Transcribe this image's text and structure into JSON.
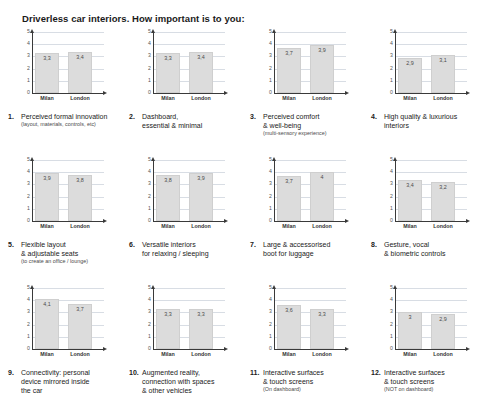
{
  "page": {
    "title": "Driverless car interiors. How important is to you:"
  },
  "axis": {
    "y_ticks": [
      "5",
      "4",
      "3",
      "2",
      "1",
      "0"
    ],
    "y_min": 0,
    "y_max": 5,
    "categories": [
      "Milan",
      "London"
    ]
  },
  "colors": {
    "bar_fill": "#dcdcdc",
    "bar_stroke": "#cfcfcf",
    "gridline": "#d8dde4",
    "axis": "#3a3a3a",
    "text": "#1a1a1a"
  },
  "chart_data": [
    {
      "type": "bar",
      "number": "1.",
      "title": "Perceived formal innovation",
      "subtitle": "(layout, materials, controls, etc)",
      "categories": [
        "Milan",
        "London"
      ],
      "values": [
        3.3,
        3.4
      ],
      "labels": [
        "3,3",
        "3,4"
      ],
      "ylim": [
        0,
        5
      ],
      "ylabel": "",
      "xlabel": "",
      "grid": true
    },
    {
      "type": "bar",
      "number": "2.",
      "title": "Dashboard,\nessential & minimal",
      "subtitle": "",
      "categories": [
        "Milan",
        "London"
      ],
      "values": [
        3.3,
        3.4
      ],
      "labels": [
        "3,3",
        "3,4"
      ],
      "ylim": [
        0,
        5
      ],
      "ylabel": "",
      "xlabel": "",
      "grid": true
    },
    {
      "type": "bar",
      "number": "3.",
      "title": "Perceived comfort\n& well-being",
      "subtitle": "(multi-sensory experience)",
      "categories": [
        "Milan",
        "London"
      ],
      "values": [
        3.7,
        3.9
      ],
      "labels": [
        "3,7",
        "3,9"
      ],
      "ylim": [
        0,
        5
      ],
      "ylabel": "",
      "xlabel": "",
      "grid": true
    },
    {
      "type": "bar",
      "number": "4.",
      "title": "High quality & luxurious\ninteriors",
      "subtitle": "",
      "categories": [
        "Milan",
        "London"
      ],
      "values": [
        2.9,
        3.1
      ],
      "labels": [
        "2,9",
        "3,1"
      ],
      "ylim": [
        0,
        5
      ],
      "ylabel": "",
      "xlabel": "",
      "grid": true
    },
    {
      "type": "bar",
      "number": "5.",
      "title": "Flexible layout\n& adjustable seats",
      "subtitle": "(to create an office / lounge)",
      "categories": [
        "Milan",
        "London"
      ],
      "values": [
        3.9,
        3.8
      ],
      "labels": [
        "3,9",
        "3,8"
      ],
      "ylim": [
        0,
        5
      ],
      "ylabel": "",
      "xlabel": "",
      "grid": true
    },
    {
      "type": "bar",
      "number": "6.",
      "title": "Versatile interiors\nfor relaxing / sleeping",
      "subtitle": "",
      "categories": [
        "Milan",
        "London"
      ],
      "values": [
        3.8,
        3.9
      ],
      "labels": [
        "3,8",
        "3,9"
      ],
      "ylim": [
        0,
        5
      ],
      "ylabel": "",
      "xlabel": "",
      "grid": true
    },
    {
      "type": "bar",
      "number": "7.",
      "title": "Large & accessorised\nboot for luggage",
      "subtitle": "",
      "categories": [
        "Milan",
        "London"
      ],
      "values": [
        3.7,
        4.0
      ],
      "labels": [
        "3,7",
        "4"
      ],
      "ylim": [
        0,
        5
      ],
      "ylabel": "",
      "xlabel": "",
      "grid": true
    },
    {
      "type": "bar",
      "number": "8.",
      "title": "Gesture, vocal\n& biometric controls",
      "subtitle": "",
      "categories": [
        "Milan",
        "London"
      ],
      "values": [
        3.4,
        3.2
      ],
      "labels": [
        "3,4",
        "3,2"
      ],
      "ylim": [
        0,
        5
      ],
      "ylabel": "",
      "xlabel": "",
      "grid": true
    },
    {
      "type": "bar",
      "number": "9.",
      "title": "Connectivity: personal\ndevice mirrored inside\nthe car",
      "subtitle": "",
      "categories": [
        "Milan",
        "London"
      ],
      "values": [
        4.1,
        3.7
      ],
      "labels": [
        "4,1",
        "3,7"
      ],
      "ylim": [
        0,
        5
      ],
      "ylabel": "",
      "xlabel": "",
      "grid": true
    },
    {
      "type": "bar",
      "number": "10.",
      "title": "Augmented reality,\nconnection with spaces\n& other vehicles",
      "subtitle": "",
      "categories": [
        "Milan",
        "London"
      ],
      "values": [
        3.3,
        3.3
      ],
      "labels": [
        "3,3",
        "3,3"
      ],
      "ylim": [
        0,
        5
      ],
      "ylabel": "",
      "xlabel": "",
      "grid": true
    },
    {
      "type": "bar",
      "number": "11.",
      "title": "Interactive surfaces\n& touch screens",
      "subtitle": "(On dashboard)",
      "categories": [
        "Milan",
        "London"
      ],
      "values": [
        3.6,
        3.3
      ],
      "labels": [
        "3,6",
        "3,3"
      ],
      "ylim": [
        0,
        5
      ],
      "ylabel": "",
      "xlabel": "",
      "grid": true
    },
    {
      "type": "bar",
      "number": "12.",
      "title": "Interactive surfaces\n& touch screens",
      "subtitle": "(NOT on dashboard)",
      "categories": [
        "Milan",
        "London"
      ],
      "values": [
        3.0,
        2.9
      ],
      "labels": [
        "3",
        "2,9"
      ],
      "ylim": [
        0,
        5
      ],
      "ylabel": "",
      "xlabel": "",
      "grid": true
    }
  ]
}
